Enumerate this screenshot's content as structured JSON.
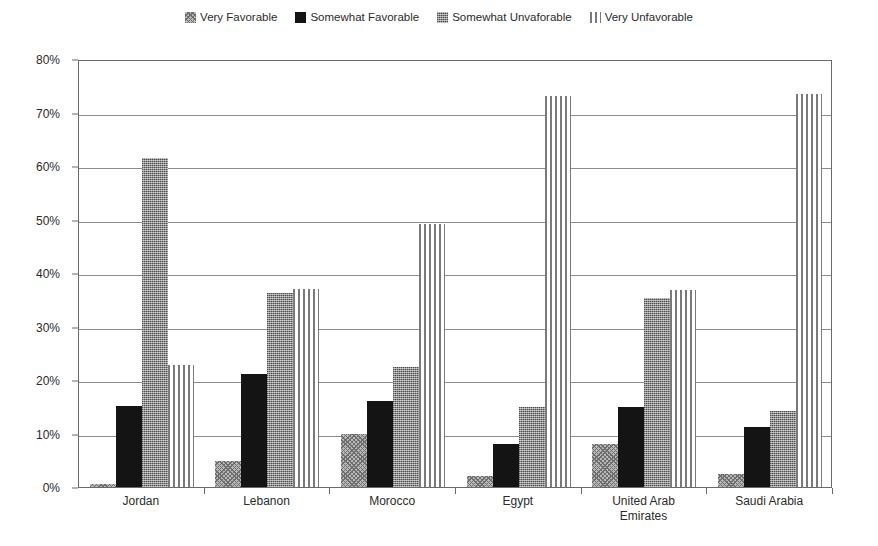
{
  "chart_data": {
    "type": "bar",
    "title": "",
    "xlabel": "",
    "ylabel": "",
    "ylim": [
      0,
      80
    ],
    "grid": true,
    "legend_position": "top-center",
    "y_ticks": [
      "0%",
      "10%",
      "20%",
      "30%",
      "40%",
      "50%",
      "60%",
      "70%",
      "80%"
    ],
    "y_tick_values": [
      0,
      10,
      20,
      30,
      40,
      50,
      60,
      70,
      80
    ],
    "categories": [
      "Jordan",
      "Lebanon",
      "Morocco",
      "Egypt",
      "United Arab\nEmirates",
      "Saudi Arabia"
    ],
    "series": [
      {
        "name": "Very Favorable",
        "pattern": "crosshatch",
        "color": "#b9b9b9",
        "values": [
          0.5,
          4.8,
          10.0,
          2.0,
          8.0,
          2.5
        ]
      },
      {
        "name": "Somewhat Favorable",
        "pattern": "solid-dark",
        "color": "#141414",
        "values": [
          15.1,
          21.1,
          16.0,
          8.0,
          15.0,
          11.3
        ]
      },
      {
        "name": "Somewhat Unvaforable",
        "pattern": "dots",
        "color": "#8f8f8f",
        "values": [
          61.5,
          36.3,
          22.4,
          14.9,
          35.3,
          14.3
        ]
      },
      {
        "name": "Very Unfavorable",
        "pattern": "vstripes",
        "color": "#7a7a7a",
        "values": [
          22.9,
          37.1,
          49.1,
          73.0,
          36.8,
          73.4
        ]
      }
    ]
  },
  "legend": {
    "items": [
      {
        "label": "Very Favorable",
        "pattern": "crosshatch"
      },
      {
        "label": "Somewhat Favorable",
        "pattern": "solid-dark"
      },
      {
        "label": "Somewhat Unvaforable",
        "pattern": "dots"
      },
      {
        "label": "Very Unfavorable",
        "pattern": "vstripes"
      }
    ]
  }
}
